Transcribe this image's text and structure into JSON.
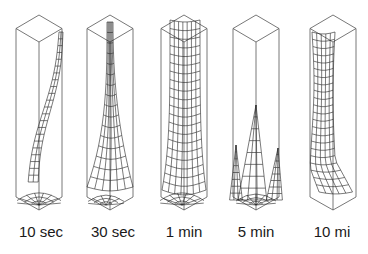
{
  "figure": {
    "colors": {
      "background": "#ffffff",
      "box_stroke": "#555555",
      "mesh_stroke": "#222222",
      "label": "#1a1a1a"
    },
    "panels": [
      {
        "label": "10 sec",
        "cx": 39,
        "label_x": 41
      },
      {
        "label": "30 sec",
        "cx": 110,
        "label_x": 113
      },
      {
        "label": "1 min",
        "cx": 184,
        "label_x": 184
      },
      {
        "label": "5 min",
        "cx": 256,
        "label_x": 256
      },
      {
        "label": "10 mi",
        "cx": 333,
        "label_x": 332
      }
    ]
  }
}
